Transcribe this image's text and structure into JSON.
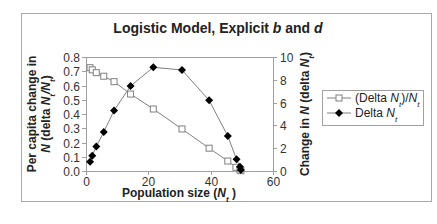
{
  "chart_data": {
    "type": "line",
    "title": "Logistic Model, Explicit b and d",
    "title_parts": [
      {
        "text": "Logistic Model, Explicit ",
        "italic": false
      },
      {
        "text": "b",
        "italic": true
      },
      {
        "text": " and ",
        "italic": false
      },
      {
        "text": "d",
        "italic": true
      }
    ],
    "xlabel": "Population size (Nt)",
    "xlabel_parts": [
      {
        "text": "Population size (",
        "italic": false
      },
      {
        "text": "N",
        "italic": true,
        "sub": "t"
      },
      {
        "text": " )",
        "italic": false
      }
    ],
    "ylabel_left": "Per capita change in N (delta Nt/Nt)",
    "ylabel_left_lines": [
      [
        {
          "text": "Per capita change in",
          "italic": false
        }
      ],
      [
        {
          "text": "N",
          "italic": true
        },
        {
          "text": " (delta ",
          "italic": false
        },
        {
          "text": "N",
          "italic": true,
          "sub": "t"
        },
        {
          "text": "/",
          "italic": true
        },
        {
          "text": "N",
          "italic": true,
          "sub": "t"
        },
        {
          "text": ")",
          "italic": false
        }
      ]
    ],
    "ylabel_right": "Change in N (delta Nt)",
    "ylabel_right_parts": [
      {
        "text": "Change in ",
        "italic": false
      },
      {
        "text": "N",
        "italic": true
      },
      {
        "text": " (delta ",
        "italic": false
      },
      {
        "text": "N",
        "italic": true,
        "sub": "t"
      },
      {
        "text": ")",
        "italic": false
      }
    ],
    "xlim": [
      0,
      60
    ],
    "xticks": [
      0,
      20,
      40,
      60
    ],
    "ylim_left": [
      0.0,
      0.8
    ],
    "yticks_left": [
      "0.0",
      "0.1",
      "0.2",
      "0.3",
      "0.4",
      "0.5",
      "0.6",
      "0.7",
      "0.8"
    ],
    "ylim_right": [
      0,
      10
    ],
    "yticks_right": [
      "0",
      "2",
      "4",
      "6",
      "8",
      "10"
    ],
    "grid": false,
    "legend_position": "right",
    "series": [
      {
        "name": "(Delta Nt)/Nt",
        "legend_parts": [
          {
            "text": "(Delta ",
            "italic": false
          },
          {
            "text": "N",
            "italic": true,
            "sub": "t"
          },
          {
            "text": ")/",
            "italic": false
          },
          {
            "text": "N",
            "italic": true,
            "sub": "t"
          }
        ],
        "axis": "left",
        "marker": "square-open",
        "color": "#808080",
        "x": [
          1.3,
          2.0,
          3.3,
          5.7,
          9.0,
          14.3,
          21.6,
          30.8,
          39.5,
          45.5,
          48.1,
          49.4,
          49.7
        ],
        "y": [
          0.725,
          0.71,
          0.69,
          0.665,
          0.627,
          0.54,
          0.435,
          0.295,
          0.16,
          0.07,
          0.026,
          0.008,
          0.002
        ]
      },
      {
        "name": "Delta Nt",
        "legend_parts": [
          {
            "text": "Delta ",
            "italic": false
          },
          {
            "text": "N",
            "italic": true,
            "sub": "t"
          }
        ],
        "axis": "right",
        "marker": "diamond-filled",
        "color": "#000000",
        "x": [
          1.3,
          2.0,
          3.3,
          5.7,
          9.0,
          14.3,
          21.6,
          30.8,
          39.5,
          45.5,
          48.3,
          49.4,
          49.7
        ],
        "y": [
          0.82,
          1.34,
          2.16,
          3.42,
          5.3,
          7.46,
          9.1,
          8.86,
          6.2,
          3.07,
          1.03,
          0.38,
          0.09
        ]
      }
    ]
  },
  "colors": {
    "frame": "#a0a0a0",
    "axis": "#a0a0a0",
    "line": "#808080",
    "marker_dark": "#000000"
  }
}
